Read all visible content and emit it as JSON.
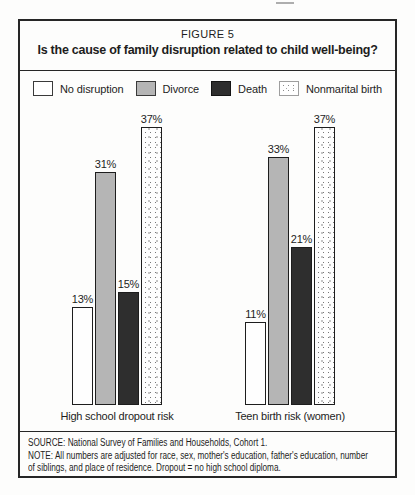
{
  "figure": {
    "kicker": "FIGURE 5",
    "title": "Is the cause of family disruption related to child well-being?"
  },
  "legend": {
    "items": [
      {
        "label": "No disruption",
        "style": "sw-white",
        "color": "#ffffff"
      },
      {
        "label": "Divorce",
        "style": "sw-gray",
        "color": "#b5b5b5"
      },
      {
        "label": "Death",
        "style": "sw-black",
        "color": "#2e2e2e"
      },
      {
        "label": "Nonmarital birth",
        "style": "sw-dots",
        "color": "#ffffff",
        "pattern": "stipple-dots"
      }
    ]
  },
  "chart_data": {
    "type": "bar",
    "title": "Is the cause of family disruption related to child well-being?",
    "unit": "%",
    "series": [
      "No disruption",
      "Divorce",
      "Death",
      "Nonmarital birth"
    ],
    "categories": [
      "High school dropout risk",
      "Teen birth risk (women)"
    ],
    "groups": [
      {
        "category": "High school dropout risk",
        "values": [
          13,
          31,
          15,
          37
        ],
        "labels": [
          "13%",
          "31%",
          "15%",
          "37%"
        ]
      },
      {
        "category": "Teen birth risk (women)",
        "values": [
          11,
          33,
          21,
          37
        ],
        "labels": [
          "11%",
          "33%",
          "21%",
          "37%"
        ]
      }
    ],
    "ylim": [
      0,
      40
    ],
    "axes": "none",
    "grid": false,
    "legend_position": "top",
    "value_labels_position": "above-bar"
  },
  "notes": {
    "source": "SOURCE: National Survey of Families and Households, Cohort 1.",
    "note_line1": "NOTE: All numbers are adjusted for race, sex, mother's education, father's education, number",
    "note_line2": "of siblings, and place of residence. Dropout = no high school diploma."
  },
  "colors": {
    "border_black": "#262626",
    "text_black": "#1d1d1d",
    "divorce_gray": "#b5b5b5",
    "death_dark": "#2e2e2e",
    "background": "#fdfdfc"
  }
}
